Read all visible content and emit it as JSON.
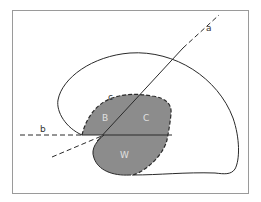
{
  "diagram": {
    "labels": {
      "a": "a",
      "b": "b",
      "c": "c",
      "B": "B",
      "C": "C",
      "W": "W"
    },
    "colors": {
      "frame": "#9a9a9a",
      "outline": "#2a2a2a",
      "shaded_region": "#8c8c8c",
      "region_label": "#e0e0e0",
      "line_label": "#333333",
      "background": "#ffffff"
    }
  }
}
